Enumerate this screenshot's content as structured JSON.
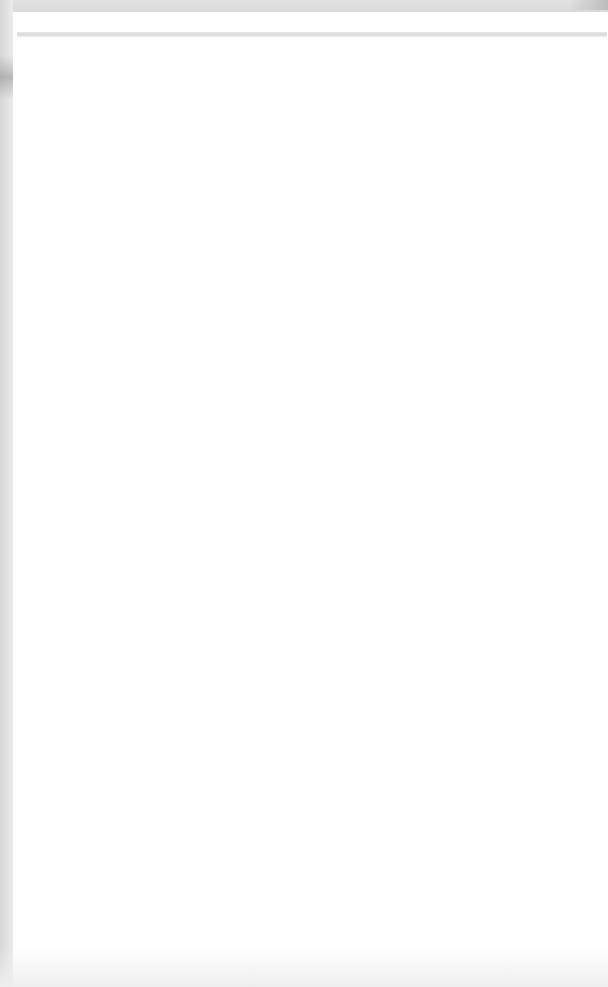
{
  "document": {
    "header_text": "",
    "body_text": "",
    "faint_marks": [
      "",
      ""
    ]
  },
  "colors": {
    "page": "#ffffff",
    "top_bar": "#dcdcdc",
    "header_rule": "#e0e0e0",
    "left_edge": "#dedede"
  }
}
